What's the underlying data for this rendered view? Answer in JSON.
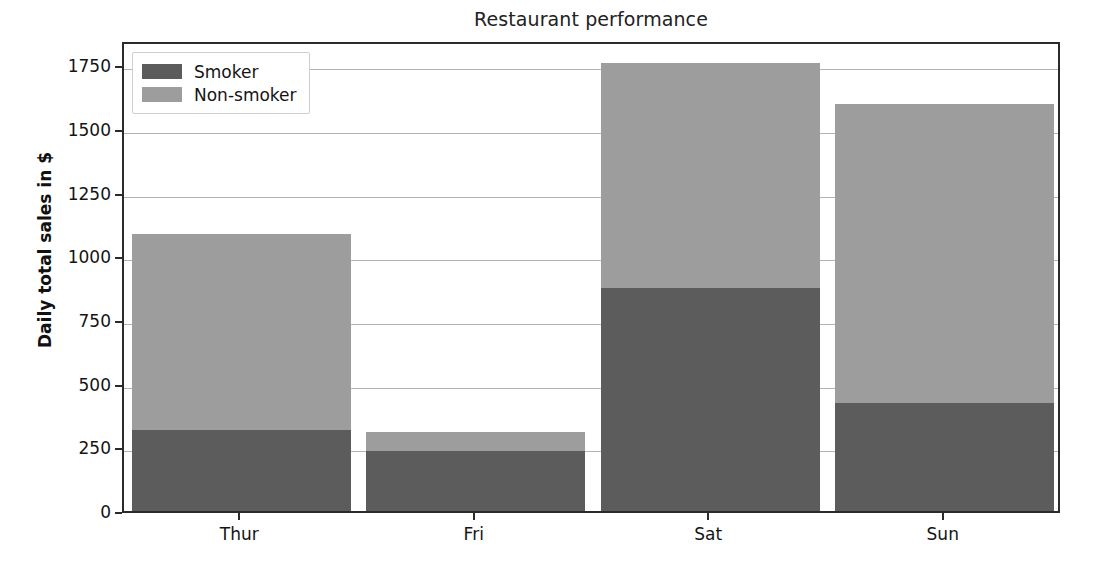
{
  "chart_data": {
    "type": "bar",
    "subtype": "stacked-vertical",
    "title": "Restaurant performance",
    "xlabel": "",
    "ylabel": "Daily total sales in $",
    "categories": [
      "Thur",
      "Fri",
      "Sat",
      "Sun"
    ],
    "series": [
      {
        "name": "Smoker",
        "color": "#5c5c5c",
        "values": [
          318,
          236,
          875,
          425
        ]
      },
      {
        "name": "Non-smoker",
        "color": "#9d9d9d",
        "values": [
          771,
          75,
          886,
          1175
        ]
      }
    ],
    "totals": [
      1089,
      311,
      1761,
      1600
    ],
    "ylim": [
      0,
      1850
    ],
    "yticks": [
      0,
      250,
      500,
      750,
      1000,
      1250,
      1500,
      1750
    ],
    "ytick_labels": [
      "0",
      "250",
      "500",
      "750",
      "1000",
      "1250",
      "1500",
      "1750"
    ],
    "grid": true,
    "grid_axis": "y",
    "legend": {
      "position": "upper-left",
      "entries": [
        {
          "label": "Smoker",
          "color": "#5c5c5c"
        },
        {
          "label": "Non-smoker",
          "color": "#9d9d9d"
        }
      ]
    },
    "background": "#ffffff",
    "axis_color": "#2b2b2b",
    "gridline_color": "#9a9a9a"
  }
}
